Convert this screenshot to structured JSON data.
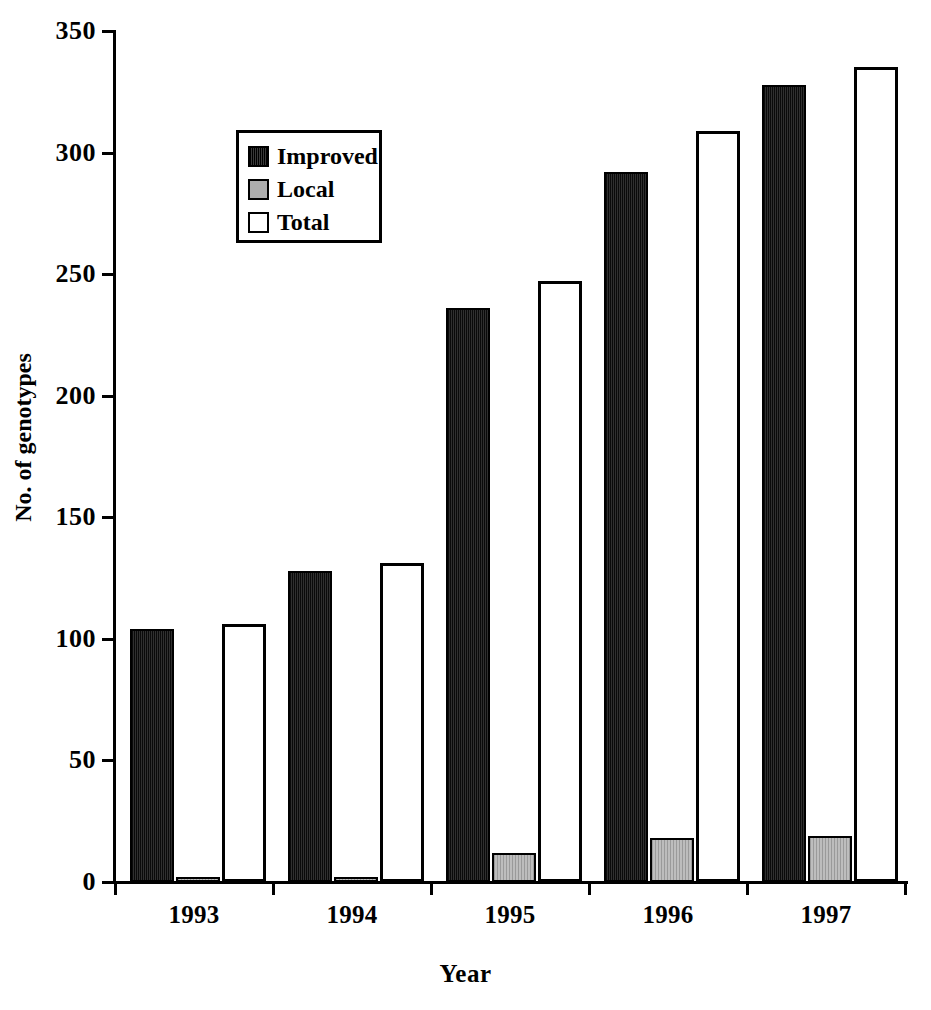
{
  "chart_data": {
    "type": "bar",
    "title": "",
    "xlabel": "Year",
    "ylabel": "No. of genotypes",
    "categories": [
      "1993",
      "1994",
      "1995",
      "1996",
      "1997"
    ],
    "series": [
      {
        "name": "Improved",
        "color": "#151515",
        "values": [
          104,
          128,
          236,
          292,
          328
        ]
      },
      {
        "name": "Local",
        "color": "#adadad",
        "values": [
          2,
          2,
          12,
          18,
          19
        ]
      },
      {
        "name": "Total",
        "color": "#ffffff",
        "values": [
          106,
          131,
          247,
          309,
          335
        ]
      }
    ],
    "ylim": [
      0,
      350
    ],
    "yticks": [
      0,
      50,
      100,
      150,
      200,
      250,
      300,
      350
    ],
    "ytick_labels": [
      "0",
      "50",
      "100",
      "150",
      "200",
      "250",
      "300",
      "350"
    ],
    "grid": false,
    "legend_position": "upper-left-inside"
  },
  "legend": {
    "entries": [
      {
        "label": "Improved",
        "swatch": "improved"
      },
      {
        "label": "Local",
        "swatch": "local"
      },
      {
        "label": "Total",
        "swatch": "total"
      }
    ]
  },
  "axes": {
    "x_title": "Year",
    "y_title": "No. of genotypes"
  }
}
